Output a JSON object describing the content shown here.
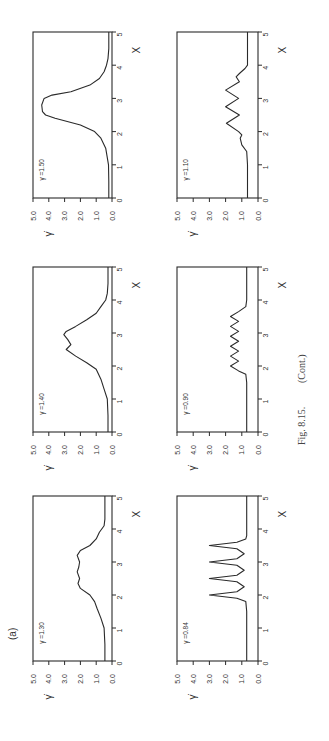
{
  "figure": {
    "caption_label": "Fig. 8.15.",
    "caption_note": "(Cont.)",
    "panel_set_label": "(a)",
    "rotation_deg": -90
  },
  "axes": {
    "xlabel": "X",
    "ylabel": "γ̇",
    "x_ticks": [
      "0",
      "1",
      "2",
      "3",
      "4",
      "5"
    ],
    "y_ticks": [
      "0.0",
      "1.0",
      "2.0",
      "3.0",
      "4.0",
      "5.0"
    ],
    "xlim": [
      0,
      5
    ],
    "ylim": [
      0,
      5
    ]
  },
  "chart_data": [
    {
      "type": "line",
      "title": "γ =1.50",
      "panel": "col1-row1",
      "xlabel": "X",
      "ylabel": "γ̇",
      "xlim": [
        0,
        5
      ],
      "ylim": [
        0,
        5
      ],
      "x": [
        0,
        0.5,
        1.0,
        1.5,
        1.8,
        2.0,
        2.2,
        2.4,
        2.5,
        2.6,
        2.8,
        3.0,
        3.1,
        3.2,
        3.4,
        3.6,
        3.8,
        4.0,
        4.2,
        4.5,
        5.0
      ],
      "y": [
        0.2,
        0.2,
        0.22,
        0.4,
        0.7,
        1.1,
        2.0,
        3.6,
        4.2,
        4.4,
        4.45,
        4.3,
        3.8,
        2.6,
        1.4,
        0.8,
        0.5,
        0.35,
        0.25,
        0.2,
        0.2
      ]
    },
    {
      "type": "line",
      "title": "γ =1.40",
      "panel": "col1-row2",
      "xlabel": "X",
      "ylabel": "γ̇",
      "xlim": [
        0,
        5
      ],
      "ylim": [
        0,
        5
      ],
      "x": [
        0,
        0.5,
        1.0,
        1.3,
        1.6,
        1.9,
        2.1,
        2.3,
        2.5,
        2.65,
        2.8,
        2.95,
        3.05,
        3.2,
        3.4,
        3.6,
        3.8,
        4.0,
        4.2,
        4.5,
        5.0
      ],
      "y": [
        0.25,
        0.25,
        0.3,
        0.5,
        0.7,
        1.0,
        1.6,
        2.3,
        2.9,
        2.6,
        2.8,
        3.05,
        2.9,
        2.3,
        1.6,
        1.0,
        0.7,
        0.4,
        0.3,
        0.25,
        0.25
      ]
    },
    {
      "type": "line",
      "title": "γ =1.30",
      "panel": "col1-row3",
      "xlabel": "X",
      "ylabel": "γ̇",
      "xlim": [
        0,
        5
      ],
      "ylim": [
        0,
        5
      ],
      "x": [
        0,
        0.5,
        1.0,
        1.3,
        1.6,
        1.8,
        2.0,
        2.2,
        2.35,
        2.5,
        2.7,
        2.85,
        3.0,
        3.2,
        3.35,
        3.5,
        3.7,
        3.9,
        4.1,
        4.3,
        5.0
      ],
      "y": [
        0.45,
        0.45,
        0.5,
        0.7,
        0.95,
        1.1,
        1.4,
        2.0,
        2.15,
        2.05,
        2.2,
        2.1,
        2.05,
        2.2,
        2.0,
        1.4,
        1.0,
        0.8,
        0.5,
        0.45,
        0.45
      ]
    },
    {
      "type": "line",
      "title": "γ =1.10",
      "panel": "col2-row1",
      "xlabel": "X",
      "ylabel": "γ̇",
      "xlim": [
        0,
        5
      ],
      "ylim": [
        0,
        5
      ],
      "x": [
        0,
        0.5,
        1.0,
        1.4,
        1.6,
        1.8,
        1.9,
        2.0,
        2.25,
        2.5,
        2.75,
        3.0,
        3.25,
        3.5,
        3.65,
        3.75,
        3.9,
        4.0,
        4.2,
        5.0
      ],
      "y": [
        0.65,
        0.65,
        0.65,
        0.7,
        1.0,
        1.1,
        1.0,
        1.2,
        1.95,
        1.15,
        2.0,
        1.2,
        2.0,
        1.15,
        1.35,
        1.15,
        0.8,
        0.65,
        0.65,
        0.65
      ]
    },
    {
      "type": "line",
      "title": "γ =0.90",
      "panel": "col2-row2",
      "xlabel": "X",
      "ylabel": "γ̇",
      "xlim": [
        0,
        5
      ],
      "ylim": [
        0,
        5
      ],
      "x": [
        0,
        0.5,
        1.0,
        1.5,
        1.75,
        1.85,
        2.0,
        2.15,
        2.3,
        2.45,
        2.6,
        2.75,
        2.9,
        3.05,
        3.2,
        3.35,
        3.5,
        3.65,
        3.8,
        4.0,
        5.0
      ],
      "y": [
        0.7,
        0.7,
        0.7,
        0.7,
        0.75,
        1.2,
        1.7,
        1.2,
        1.7,
        1.2,
        1.7,
        1.2,
        1.7,
        1.2,
        1.7,
        1.2,
        1.7,
        1.2,
        0.75,
        0.7,
        0.7
      ]
    },
    {
      "type": "line",
      "title": "γ =0.84",
      "panel": "col2-row3",
      "xlabel": "X",
      "ylabel": "γ̇",
      "xlim": [
        0,
        5
      ],
      "ylim": [
        0,
        5
      ],
      "x": [
        0,
        0.5,
        1.0,
        1.5,
        1.8,
        1.9,
        2.0,
        2.1,
        2.25,
        2.4,
        2.5,
        2.6,
        2.75,
        2.9,
        3.0,
        3.1,
        3.25,
        3.4,
        3.5,
        3.6,
        3.7,
        3.8,
        4.0,
        5.0
      ],
      "y": [
        0.7,
        0.7,
        0.7,
        0.7,
        0.75,
        1.3,
        3.0,
        1.3,
        0.85,
        1.3,
        3.0,
        1.3,
        0.85,
        1.3,
        3.0,
        1.3,
        0.85,
        1.3,
        3.0,
        1.3,
        0.75,
        0.7,
        0.7,
        0.7
      ]
    }
  ],
  "layout": {
    "panels": [
      {
        "title_index": 0,
        "left": 33,
        "right": 112,
        "top": 32,
        "bottom": 198
      },
      {
        "title_index": 1,
        "left": 33,
        "right": 112,
        "top": 267,
        "bottom": 432
      },
      {
        "title_index": 2,
        "left": 33,
        "right": 112,
        "top": 496,
        "bottom": 661
      },
      {
        "title_index": 3,
        "left": 177,
        "right": 258,
        "top": 32,
        "bottom": 198
      },
      {
        "title_index": 4,
        "left": 177,
        "right": 258,
        "top": 267,
        "bottom": 432
      },
      {
        "title_index": 5,
        "left": 177,
        "right": 258,
        "top": 496,
        "bottom": 661
      }
    ],
    "line_color": "#2a2a2a"
  }
}
